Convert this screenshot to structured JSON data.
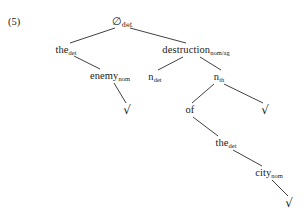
{
  "example": {
    "number_label": "(5)"
  },
  "diagram": {
    "type": "syntax-tree",
    "line_color": "#2b2b2b",
    "text_color": "#1a1a1a",
    "background": "#ffffff",
    "nodes": [
      {
        "id": "root",
        "base": "∅",
        "subscript": "det",
        "x": 122,
        "y": 21,
        "kind": "empty-det"
      },
      {
        "id": "the1",
        "base": "the",
        "subscript": "det",
        "x": 66,
        "y": 50,
        "kind": "label"
      },
      {
        "id": "destruction",
        "base": "destruction",
        "subscript": "nom/ag",
        "x": 196,
        "y": 50,
        "kind": "label"
      },
      {
        "id": "enemy",
        "base": "enemy",
        "subscript": "nom",
        "x": 110,
        "y": 76,
        "kind": "label"
      },
      {
        "id": "ndet",
        "base": "n",
        "subscript": "det",
        "x": 155,
        "y": 77,
        "kind": "label"
      },
      {
        "id": "nth",
        "base": "n",
        "subscript": "th",
        "x": 219,
        "y": 77,
        "kind": "label"
      },
      {
        "id": "check1",
        "base": "√",
        "subscript": "",
        "x": 127,
        "y": 110,
        "kind": "check"
      },
      {
        "id": "of",
        "base": "of",
        "subscript": "",
        "x": 190,
        "y": 110,
        "kind": "label"
      },
      {
        "id": "check2",
        "base": "√",
        "subscript": "",
        "x": 265,
        "y": 110,
        "kind": "check"
      },
      {
        "id": "the2",
        "base": "the",
        "subscript": "det",
        "x": 226,
        "y": 143,
        "kind": "label"
      },
      {
        "id": "city",
        "base": "city",
        "subscript": "nom",
        "x": 269,
        "y": 173,
        "kind": "label"
      },
      {
        "id": "check3",
        "base": "√",
        "subscript": "",
        "x": 289,
        "y": 203,
        "kind": "check"
      }
    ],
    "edges": [
      {
        "from": "root",
        "to": "the1",
        "x1": 115,
        "y1": 28,
        "x2": 70,
        "y2": 43
      },
      {
        "from": "root",
        "to": "destruction",
        "x1": 130,
        "y1": 28,
        "x2": 186,
        "y2": 43
      },
      {
        "from": "the1",
        "to": "enemy",
        "x1": 74,
        "y1": 56,
        "x2": 100,
        "y2": 69
      },
      {
        "from": "destruction",
        "to": "ndet",
        "x1": 183,
        "y1": 57,
        "x2": 158,
        "y2": 70
      },
      {
        "from": "destruction",
        "to": "nth",
        "x1": 200,
        "y1": 57,
        "x2": 221,
        "y2": 70
      },
      {
        "from": "enemy",
        "to": "check1",
        "x1": 114,
        "y1": 83,
        "x2": 126,
        "y2": 103
      },
      {
        "from": "nth",
        "to": "of",
        "x1": 214,
        "y1": 84,
        "x2": 192,
        "y2": 103
      },
      {
        "from": "nth",
        "to": "check2",
        "x1": 224,
        "y1": 84,
        "x2": 263,
        "y2": 103
      },
      {
        "from": "of",
        "to": "the2",
        "x1": 193,
        "y1": 117,
        "x2": 218,
        "y2": 136
      },
      {
        "from": "the2",
        "to": "city",
        "x1": 233,
        "y1": 150,
        "x2": 262,
        "y2": 166
      },
      {
        "from": "city",
        "to": "check3",
        "x1": 272,
        "y1": 180,
        "x2": 288,
        "y2": 196
      }
    ]
  }
}
